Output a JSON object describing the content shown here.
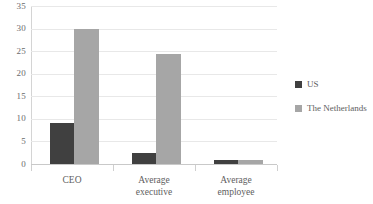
{
  "chart_data": {
    "type": "bar",
    "title": "",
    "subtitle": "",
    "xlabel": "",
    "ylabel": "",
    "categories": [
      "CEO",
      "Average executive",
      "Average employee"
    ],
    "category_lines": [
      [
        "CEO"
      ],
      [
        "Average",
        "executive"
      ],
      [
        "Average",
        "employee"
      ]
    ],
    "series": [
      {
        "name": "US",
        "color": "#404040",
        "values": [
          9.0,
          2.4,
          0.9
        ]
      },
      {
        "name": "The Netherlands",
        "color": "#a6a6a6",
        "values": [
          30.0,
          24.3,
          0.8
        ]
      }
    ],
    "ylim": [
      0,
      35
    ],
    "yticks": [
      0,
      5,
      10,
      15,
      20,
      25,
      30,
      35
    ],
    "ytick_labels": [
      "0",
      "5",
      "10",
      "15",
      "20",
      "25",
      "30",
      "35"
    ],
    "grid": true,
    "legend_position": "right",
    "gridline_color": "#e8e8e8",
    "axis_color": "#c9c9c9",
    "text_color": "#5e5e5e"
  },
  "legend": {
    "items": [
      {
        "label": "US",
        "color": "#404040"
      },
      {
        "label": "The Netherlands",
        "color": "#a6a6a6"
      }
    ]
  }
}
